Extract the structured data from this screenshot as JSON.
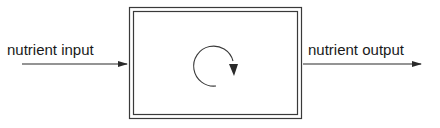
{
  "diagram": {
    "type": "compartment-flow",
    "input": {
      "label": "nutrient input"
    },
    "output": {
      "label": "nutrient output"
    },
    "box": {
      "style": "double-border",
      "contents": "clockwise-cycle-arrow"
    },
    "colors": {
      "stroke": "#2a2a2a",
      "text": "#1a1a1a",
      "background": "#ffffff"
    }
  }
}
